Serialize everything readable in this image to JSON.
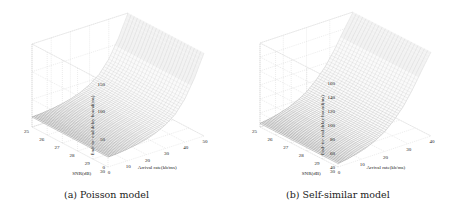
{
  "chart_data": [
    {
      "type": "surface3d",
      "panel_label": "(a) Poisson model",
      "title": "",
      "xlabel": "Arrival rate(kb/ms)",
      "ylabel": "SNR(dB)",
      "zlabel": "End- to- end delay bound(ms)",
      "xlim": [
        0,
        50
      ],
      "ylim": [
        25,
        30
      ],
      "zlim": [
        0,
        150
      ],
      "xticks": [
        "0",
        "10",
        "20",
        "30",
        "40",
        "50"
      ],
      "yticks": [
        "25",
        "26",
        "27",
        "28",
        "29",
        "30"
      ],
      "zticks": [
        "0",
        "50",
        "100",
        "150"
      ],
      "grid": true,
      "x": [
        0,
        5,
        10,
        15,
        20,
        25,
        30,
        35,
        40,
        45,
        50
      ],
      "y": [
        25,
        26,
        27,
        28,
        29,
        30
      ],
      "z_profile_vs_x": [
        18,
        19,
        21,
        24,
        28,
        34,
        43,
        56,
        78,
        110,
        150
      ],
      "note": "Delay bound grows rapidly with arrival rate; nearly constant across SNR"
    },
    {
      "type": "surface3d",
      "panel_label": "(b) Self-similar model",
      "title": "",
      "xlabel": "Arrival rate(kb/ms)",
      "ylabel": "SNR(dB)",
      "zlabel": "End- to- end delay bound(ms)",
      "xlim": [
        0,
        40
      ],
      "ylim": [
        25,
        30
      ],
      "zlim": [
        40,
        160
      ],
      "xticks": [
        "0",
        "10",
        "20",
        "30",
        "40"
      ],
      "yticks": [
        "25",
        "26",
        "27",
        "28",
        "29",
        "30"
      ],
      "zticks": [
        "40",
        "60",
        "80",
        "100",
        "120",
        "140",
        "160"
      ],
      "grid": true,
      "x": [
        0,
        4,
        8,
        12,
        16,
        20,
        24,
        28,
        32,
        36,
        40
      ],
      "y": [
        25,
        26,
        27,
        28,
        29,
        30
      ],
      "z_profile_vs_x": [
        45,
        47,
        50,
        54,
        60,
        68,
        80,
        95,
        115,
        138,
        160
      ],
      "note": "Delay bound grows with arrival rate; nearly constant across SNR"
    }
  ],
  "captions": {
    "a": "(a) Poisson model",
    "b": "(b) Self-similar model"
  }
}
